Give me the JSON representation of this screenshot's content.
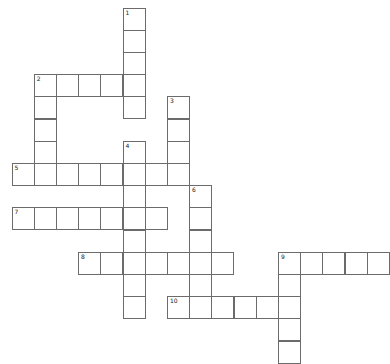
{
  "puzzle": {
    "type": "crossword",
    "origin": {
      "x": 12,
      "y": 8
    },
    "cell_size": 22.2,
    "words": [
      {
        "number": "1",
        "direction": "down",
        "row": 0,
        "col": 5,
        "length": 5
      },
      {
        "number": "2",
        "direction": "across",
        "row": 3,
        "col": 1,
        "length": 5
      },
      {
        "number": "2",
        "direction": "down",
        "row": 3,
        "col": 1,
        "length": 5
      },
      {
        "number": "3",
        "direction": "down",
        "row": 4,
        "col": 7,
        "length": 4
      },
      {
        "number": "4",
        "direction": "down",
        "row": 6,
        "col": 5,
        "length": 8
      },
      {
        "number": "5",
        "direction": "across",
        "row": 7,
        "col": 0,
        "length": 8
      },
      {
        "number": "6",
        "direction": "down",
        "row": 8,
        "col": 8,
        "length": 6
      },
      {
        "number": "7",
        "direction": "across",
        "row": 9,
        "col": 0,
        "length": 7
      },
      {
        "number": "8",
        "direction": "across",
        "row": 11,
        "col": 3,
        "length": 7
      },
      {
        "number": "9",
        "direction": "across",
        "row": 11,
        "col": 12,
        "length": 5
      },
      {
        "number": "9",
        "direction": "down",
        "row": 11,
        "col": 12,
        "length": 5
      },
      {
        "number": "10",
        "direction": "across",
        "row": 13,
        "col": 7,
        "length": 6
      }
    ]
  }
}
